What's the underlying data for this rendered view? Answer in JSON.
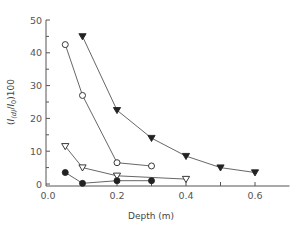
{
  "chart_data": {
    "type": "line",
    "title": "",
    "xlabel": "Depth (m)",
    "ylabel": "(I_(d)/I_0)100",
    "ylabel_parts": {
      "open": "(",
      "I": "I",
      "sub_d": "(d)",
      "slash": "/",
      "I0": "I",
      "sub_0": "0",
      "close": ")100"
    },
    "xlim": [
      0.0,
      0.7
    ],
    "ylim": [
      0,
      50
    ],
    "xticks": [
      0.0,
      0.2,
      0.4,
      0.6
    ],
    "xtick_labels": [
      "0.0",
      "0.2",
      "0.4",
      "0.6"
    ],
    "yticks": [
      0,
      10,
      20,
      30,
      40,
      50
    ],
    "ytick_labels": [
      "0",
      "10",
      "20",
      "30",
      "40",
      "50"
    ],
    "grid": false,
    "legend": null,
    "series": [
      {
        "name": "filled-down-triangle",
        "marker": "triangle-down-filled",
        "x": [
          0.1,
          0.2,
          0.3,
          0.4,
          0.5,
          0.6
        ],
        "y": [
          45,
          22.5,
          14,
          8.5,
          5,
          3.5
        ]
      },
      {
        "name": "open-circle",
        "marker": "circle-open",
        "x": [
          0.05,
          0.1,
          0.2,
          0.3
        ],
        "y": [
          42.5,
          27,
          6.5,
          5.5
        ]
      },
      {
        "name": "open-down-triangle",
        "marker": "triangle-down-open",
        "x": [
          0.05,
          0.1,
          0.2,
          0.4
        ],
        "y": [
          11.5,
          5,
          2.5,
          1.5
        ]
      },
      {
        "name": "filled-circle",
        "marker": "circle-filled",
        "x": [
          0.05,
          0.1,
          0.2,
          0.3
        ],
        "y": [
          3.5,
          0.2,
          1,
          1
        ]
      }
    ],
    "colors": {
      "line": "#555555",
      "marker": "#222222",
      "axis": "#555555"
    }
  }
}
